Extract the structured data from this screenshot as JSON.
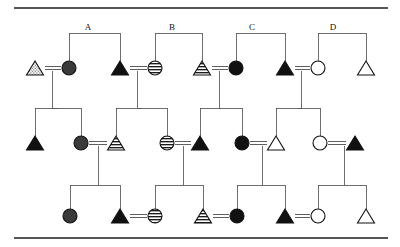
{
  "figure": {
    "type": "pedigree-chart",
    "width": 400,
    "height": 247,
    "background": "#ffffff",
    "line_color": "#555555",
    "symbol_stroke": "#111111",
    "rules": [
      {
        "name": "top-rule",
        "y": 8,
        "x1": 14,
        "x2": 388
      },
      {
        "name": "bottom-rule",
        "y": 238,
        "x1": 14,
        "x2": 388
      }
    ]
  },
  "legend_fills": {
    "solid_black": "#111111",
    "dark_gray": "#3a3a3a",
    "open_white": "#ffffff",
    "striped": "horizontal-stripes",
    "stippled": "dotted-stipple"
  },
  "sibship_labels": [
    {
      "name": "sibship-label-a",
      "text": "A",
      "x": 88,
      "y": 27
    },
    {
      "name": "sibship-label-b",
      "text": "B",
      "x": 172,
      "y": 27
    },
    {
      "name": "sibship-label-c",
      "text": "C",
      "x": 252,
      "y": 27
    },
    {
      "name": "sibship-label-d",
      "text": "D",
      "x": 333,
      "y": 27
    }
  ],
  "generations": [
    {
      "name": "generation-1",
      "y": 68,
      "individuals": [
        {
          "id": "I-1",
          "shape": "triangle",
          "fill": "stippled",
          "x": 35,
          "label": "male-stippled"
        },
        {
          "id": "I-2",
          "shape": "circle",
          "fill": "dark_gray",
          "x": 69,
          "label": "female-dark-gray"
        },
        {
          "id": "I-3",
          "shape": "triangle",
          "fill": "solid_black",
          "x": 120,
          "label": "male-black"
        },
        {
          "id": "I-4",
          "shape": "circle",
          "fill": "striped",
          "x": 155,
          "label": "female-striped"
        },
        {
          "id": "I-5",
          "shape": "triangle",
          "fill": "striped",
          "x": 202,
          "label": "male-striped"
        },
        {
          "id": "I-6",
          "shape": "circle",
          "fill": "solid_black",
          "x": 236,
          "label": "female-black"
        },
        {
          "id": "I-7",
          "shape": "triangle",
          "fill": "solid_black",
          "x": 285,
          "label": "male-black"
        },
        {
          "id": "I-8",
          "shape": "circle",
          "fill": "open_white",
          "x": 318,
          "label": "female-open"
        },
        {
          "id": "I-9",
          "shape": "triangle",
          "fill": "open_white",
          "x": 366,
          "label": "male-open"
        }
      ],
      "matings": [
        {
          "name": "mating-a",
          "left": "I-1",
          "right": "I-2"
        },
        {
          "name": "mating-b",
          "left": "I-3",
          "right": "I-4"
        },
        {
          "name": "mating-c",
          "left": "I-5",
          "right": "I-6"
        },
        {
          "name": "mating-d",
          "left": "I-7",
          "right": "I-8"
        }
      ],
      "sibship_bars": [
        {
          "name": "sibship-bar-a",
          "y": 33,
          "x1": 69,
          "x2": 120,
          "drops": [
            69,
            120
          ]
        },
        {
          "name": "sibship-bar-b",
          "y": 33,
          "x1": 155,
          "x2": 202,
          "drops": [
            155,
            202
          ]
        },
        {
          "name": "sibship-bar-c",
          "y": 33,
          "x1": 236,
          "x2": 285,
          "drops": [
            236,
            285
          ]
        },
        {
          "name": "sibship-bar-d",
          "y": 33,
          "x1": 318,
          "x2": 366,
          "drops": [
            318,
            366
          ]
        }
      ]
    },
    {
      "name": "generation-2",
      "y": 143,
      "individuals": [
        {
          "id": "II-1",
          "shape": "triangle",
          "fill": "solid_black",
          "x": 35,
          "label": "male-black"
        },
        {
          "id": "II-2",
          "shape": "circle",
          "fill": "dark_gray",
          "x": 81,
          "label": "female-dark-gray"
        },
        {
          "id": "II-3",
          "shape": "triangle",
          "fill": "striped",
          "x": 116,
          "label": "male-striped"
        },
        {
          "id": "II-4",
          "shape": "circle",
          "fill": "striped",
          "x": 167,
          "label": "female-striped"
        },
        {
          "id": "II-5",
          "shape": "triangle",
          "fill": "solid_black",
          "x": 200,
          "label": "male-black"
        },
        {
          "id": "II-6",
          "shape": "circle",
          "fill": "solid_black",
          "x": 242,
          "label": "female-black"
        },
        {
          "id": "II-7",
          "shape": "triangle",
          "fill": "open_white",
          "x": 276,
          "label": "male-open"
        },
        {
          "id": "II-8",
          "shape": "circle",
          "fill": "open_white",
          "x": 320,
          "label": "female-open"
        },
        {
          "id": "II-9",
          "shape": "triangle",
          "fill": "solid_black",
          "x": 355,
          "label": "male-black"
        }
      ],
      "matings": [
        {
          "name": "mating-2-1",
          "left": "II-2",
          "right": "II-3"
        },
        {
          "name": "mating-2-2",
          "left": "II-4",
          "right": "II-5"
        },
        {
          "name": "mating-2-3",
          "left": "II-6",
          "right": "II-7"
        },
        {
          "name": "mating-2-4",
          "left": "II-8",
          "right": "II-9"
        }
      ],
      "sibship_bars": [
        {
          "name": "sibship-bar-2-a",
          "y": 108,
          "x1": 35,
          "x2": 81,
          "drops": [
            35,
            81
          ]
        },
        {
          "name": "sibship-bar-2-b",
          "y": 108,
          "x1": 116,
          "x2": 167,
          "drops": [
            116,
            167
          ]
        },
        {
          "name": "sibship-bar-2-c",
          "y": 108,
          "x1": 200,
          "x2": 242,
          "drops": [
            200,
            242
          ]
        },
        {
          "name": "sibship-bar-2-d",
          "y": 108,
          "x1": 276,
          "x2": 320,
          "drops": [
            276,
            320
          ]
        }
      ]
    },
    {
      "name": "generation-3",
      "y": 216,
      "individuals": [
        {
          "id": "III-1",
          "shape": "circle",
          "fill": "dark_gray",
          "x": 70,
          "label": "female-dark-gray"
        },
        {
          "id": "III-2",
          "shape": "triangle",
          "fill": "solid_black",
          "x": 120,
          "label": "male-black"
        },
        {
          "id": "III-3",
          "shape": "circle",
          "fill": "striped",
          "x": 155,
          "label": "female-striped"
        },
        {
          "id": "III-4",
          "shape": "triangle",
          "fill": "striped",
          "x": 203,
          "label": "male-striped"
        },
        {
          "id": "III-5",
          "shape": "circle",
          "fill": "solid_black",
          "x": 237,
          "label": "female-black"
        },
        {
          "id": "III-6",
          "shape": "triangle",
          "fill": "solid_black",
          "x": 285,
          "label": "male-black"
        },
        {
          "id": "III-7",
          "shape": "circle",
          "fill": "open_white",
          "x": 318,
          "label": "female-open"
        },
        {
          "id": "III-8",
          "shape": "triangle",
          "fill": "open_white",
          "x": 366,
          "label": "male-open"
        }
      ],
      "matings": [
        {
          "name": "mating-3-1",
          "left": "III-2",
          "right": "III-3"
        },
        {
          "name": "mating-3-2",
          "left": "III-4",
          "right": "III-5"
        },
        {
          "name": "mating-3-3",
          "left": "III-6",
          "right": "III-7"
        }
      ],
      "sibship_bars": [
        {
          "name": "sibship-bar-3-a",
          "y": 185,
          "x1": 70,
          "x2": 120,
          "drops": [
            70,
            120
          ],
          "stem_x": 98
        },
        {
          "name": "sibship-bar-3-b",
          "y": 185,
          "x1": 155,
          "x2": 203,
          "drops": [
            155,
            203
          ],
          "stem_x": 183
        },
        {
          "name": "sibship-bar-3-c",
          "y": 185,
          "x1": 237,
          "x2": 285,
          "drops": [
            237,
            285
          ],
          "stem_x": 262
        },
        {
          "name": "sibship-bar-3-d",
          "y": 185,
          "x1": 318,
          "x2": 366,
          "drops": [
            318,
            366
          ],
          "stem_x": 344
        }
      ]
    }
  ]
}
